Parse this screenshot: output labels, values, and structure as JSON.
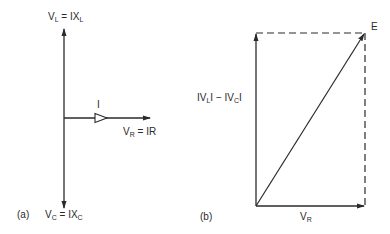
{
  "figure": {
    "panel_a": {
      "tag": "(a)",
      "vl_label": {
        "main": "V",
        "sub": "L",
        "eq": " = IX",
        "sub2": "L"
      },
      "vc_label": {
        "main": "V",
        "sub": "C",
        "eq": " = IX",
        "sub2": "C"
      },
      "vr_label": {
        "main": "V",
        "sub": "R",
        "eq": " = IR"
      },
      "current_label": "I"
    },
    "panel_b": {
      "tag": "(b)",
      "vertical_label": {
        "p1": "IV",
        "s1": "L",
        "p2": "I − IV",
        "s2": "C",
        "p3": "I"
      },
      "resultant_label": "E",
      "horizontal_label": {
        "main": "V",
        "sub": "R"
      }
    },
    "colors": {
      "stroke": "#2a2a2a",
      "background": "#ffffff"
    }
  }
}
